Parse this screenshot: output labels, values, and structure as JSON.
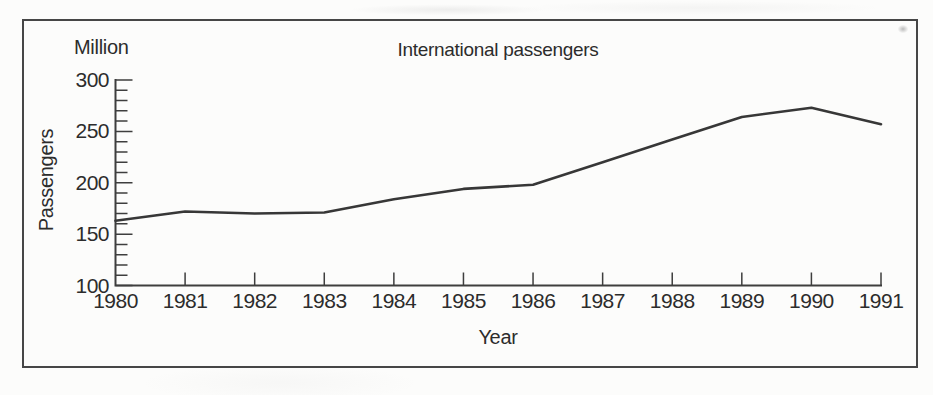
{
  "figure": {
    "frame_color": "#464646",
    "background_color": "#fcfcfb",
    "text_color": "#2c2c2c"
  },
  "chart_data": {
    "type": "line",
    "title": "International passengers",
    "unit": "Million",
    "xlabel": "Year",
    "ylabel": "Passengers",
    "categories": [
      "1980",
      "1981",
      "1982",
      "1983",
      "1984",
      "1985",
      "1986",
      "1987",
      "1988",
      "1989",
      "1990",
      "1991"
    ],
    "values": [
      163,
      172,
      170,
      171,
      184,
      194,
      198,
      220,
      242,
      264,
      273,
      257
    ],
    "ylim": [
      100,
      300
    ],
    "ytick_major": 50,
    "ytick_minor": 10,
    "grid": false,
    "legend": "none",
    "line_color": "#373737",
    "axis_color": "#3e3e3e"
  }
}
